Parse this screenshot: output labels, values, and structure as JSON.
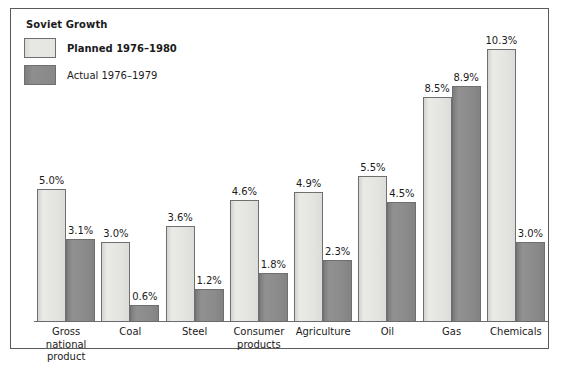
{
  "chart_data": {
    "type": "bar",
    "title": "Soviet Growth",
    "xlabel": "",
    "ylabel": "",
    "ylim": [
      0,
      10.3
    ],
    "grid": false,
    "legend_position": "top-left",
    "value_suffix": "%",
    "categories": [
      "Gross national product",
      "Coal",
      "Steel",
      "Consumer products",
      "Agriculture",
      "Oil",
      "Gas",
      "Chemicals"
    ],
    "series": [
      {
        "name": "Planned 1976–1980",
        "color": "#e4e4e1",
        "values": [
          5.0,
          3.0,
          3.6,
          4.6,
          4.9,
          5.5,
          8.5,
          10.3
        ],
        "labels": [
          "5.0%",
          "3.0%",
          "3.6%",
          "4.6%",
          "4.9%",
          "5.5%",
          "8.5%",
          "10.3%"
        ]
      },
      {
        "name": "Actual 1976–1979",
        "color": "#8a8a8a",
        "values": [
          3.1,
          0.6,
          1.2,
          1.8,
          2.3,
          4.5,
          8.9,
          3.0
        ],
        "labels": [
          "3.1%",
          "0.6%",
          "1.2%",
          "1.8%",
          "2.3%",
          "4.5%",
          "8.9%",
          "3.0%"
        ]
      }
    ],
    "category_label_lines": [
      [
        "Gross",
        "national",
        "product"
      ],
      [
        "Coal"
      ],
      [
        "Steel"
      ],
      [
        "Consumer",
        "products"
      ],
      [
        "Agriculture"
      ],
      [
        "Oil"
      ],
      [
        "Gas"
      ],
      [
        "Chemicals"
      ]
    ]
  },
  "legend": {
    "items": [
      {
        "label": "Planned 1976–1980",
        "swatch": "planned-swatch",
        "bold": true
      },
      {
        "label": "Actual 1976–1979",
        "swatch": "actual-swatch",
        "bold": false
      }
    ]
  },
  "style": {
    "frame_border": "#5a5a5a",
    "baseline": "#6b6b6b",
    "bar_outline": "#6f6f6f",
    "text": "#1b1b1b",
    "background": "#ffffff"
  }
}
